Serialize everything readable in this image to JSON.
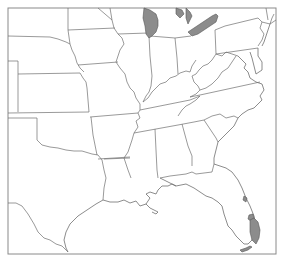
{
  "map": {
    "title": "",
    "region": "Central and Eastern United States",
    "style": "state-outline",
    "colors": {
      "background": "#ffffff",
      "outline": "#6e6e6e",
      "frame": "#8a8a8a",
      "highlight": "#8c8c8c"
    },
    "highlighted_regions": [
      {
        "name": "Lake Michigan"
      },
      {
        "name": "Lake Erie"
      },
      {
        "name": "Lake Huron (partial)"
      },
      {
        "name": "Lake Okeechobee"
      },
      {
        "name": "Southeast Florida / Everglades"
      },
      {
        "name": "Florida Keys"
      }
    ]
  }
}
